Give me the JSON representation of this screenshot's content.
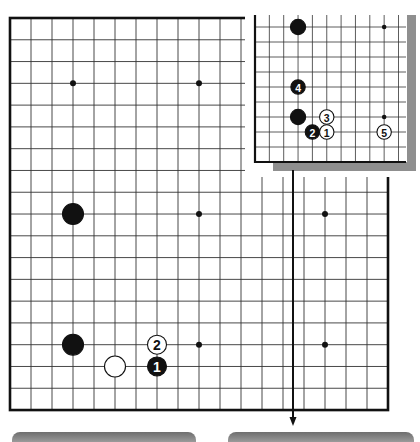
{
  "diagram": {
    "type": "go-board-diagram",
    "main_board": {
      "origin": {
        "x": 10,
        "y": 18
      },
      "cols": 19,
      "rows": 19,
      "step_x": 21,
      "step_y": 21.78,
      "border_color": "#111111",
      "line_color": "#333333",
      "star_points": [
        [
          3,
          3
        ],
        [
          9,
          3
        ],
        [
          9,
          9
        ],
        [
          15,
          9
        ],
        [
          9,
          15
        ],
        [
          15,
          15
        ]
      ],
      "stones": [
        {
          "col": 3,
          "row": 9,
          "color": "black",
          "label": ""
        },
        {
          "col": 3,
          "row": 15,
          "color": "black",
          "label": ""
        },
        {
          "col": 5,
          "row": 16,
          "color": "white",
          "label": ""
        },
        {
          "col": 7,
          "row": 15,
          "color": "white",
          "label": "2"
        },
        {
          "col": 7,
          "row": 16,
          "color": "black",
          "label": "1"
        }
      ],
      "arrow": {
        "x": 293,
        "y1": 170,
        "y2": 426
      }
    },
    "inset": {
      "origin": {
        "x": 255,
        "y": 27
      },
      "step_x": 14.35,
      "step_y": 15,
      "cols": 11,
      "rows": 10,
      "top_open_y": 15,
      "right_open_x": 406,
      "shadow_color": "#8f8f8f",
      "star_points": [
        [
          9,
          0
        ],
        [
          9,
          6
        ]
      ],
      "stones": [
        {
          "col": 3,
          "row": 0,
          "color": "black",
          "label": ""
        },
        {
          "col": 3,
          "row": 4,
          "color": "black",
          "label": "4"
        },
        {
          "col": 3,
          "row": 6,
          "color": "black",
          "label": ""
        },
        {
          "col": 4,
          "row": 7,
          "color": "black",
          "label": "2"
        },
        {
          "col": 5,
          "row": 6,
          "color": "white",
          "label": "3"
        },
        {
          "col": 5,
          "row": 7,
          "color": "white",
          "label": "1"
        },
        {
          "col": 9,
          "row": 7,
          "color": "white",
          "label": "5"
        }
      ]
    },
    "bottom_bars": [
      {
        "left": 12,
        "width": 184
      },
      {
        "left": 228,
        "width": 186
      }
    ]
  }
}
